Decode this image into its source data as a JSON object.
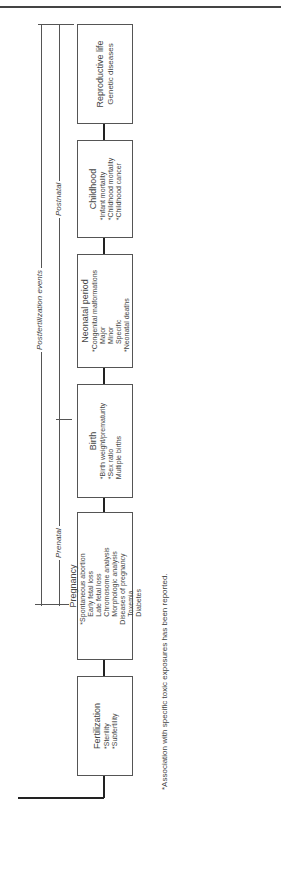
{
  "header_fragment": "...ure.",
  "timeline": {
    "postfertilization": "Postfertilization events",
    "prenatal": "Prenatal",
    "postnatal": "Postnatal"
  },
  "stages": [
    {
      "title": "Reproductive life",
      "items": [
        "Genetic diseases"
      ]
    },
    {
      "title": "Childhood",
      "items": [
        "*Infant mortality",
        "*Childhood mortality",
        "*Childhood cancer"
      ]
    },
    {
      "title": "Neonatal period",
      "items": [
        "*Congenital malformations",
        "Major",
        "Minor",
        "Specific",
        "*Neonatal deaths"
      ]
    },
    {
      "title": "Birth",
      "items": [
        "*Birth weight/prematurity",
        "*Sex ratio",
        "Multiple births"
      ]
    },
    {
      "title": "Pregnancy",
      "items": [
        "*Spontaneous abortion",
        "Early fetal loss",
        "Late fetal loss",
        "Chromosome analysis",
        "Morphologic analysis",
        "Diseases of pregnancy",
        "Toxemia",
        "Diabetes"
      ]
    },
    {
      "title": "Fertilization",
      "items": [
        "*Sterility",
        "*Subfertility"
      ]
    }
  ],
  "preconception": [
    {
      "title": "Oogenesis",
      "subtitle": "Menstrual cycle",
      "items": [
        "Menstrual irregularities",
        "Anovulatory cycles",
        "Hormone levels",
        "Endometrial biopsies"
      ]
    },
    {
      "title": "Sexual behavior",
      "items": [
        "Libido",
        "Impotence"
      ]
    },
    {
      "title": "Spermatogenesis",
      "items": [
        "*Semen parameters",
        "Count",
        "Morphology",
        "Motility",
        "*Hormone levels",
        "*Testicular biopsies"
      ]
    }
  ],
  "footnote": "*Association with specific toxic exposures has been reported."
}
